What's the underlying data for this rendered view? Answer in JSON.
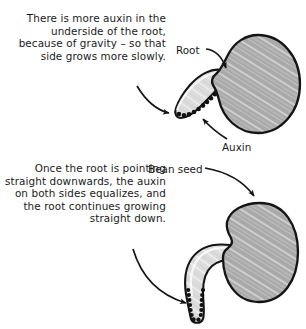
{
  "canvas": {
    "width": 306,
    "height": 329,
    "background_color": "#ffffff",
    "ink_color": "#1a1a1a"
  },
  "palette": {
    "seed_fill": "#a9a9a9",
    "seed_hatch_light": "#e8e8e8",
    "root_fill": "#dcdcdc",
    "root_shade": "#bdbdbd",
    "auxin_dot": "#111111",
    "outline": "#141414"
  },
  "captions": {
    "top": "There is more auxin in the underside of the root, because of gravity – so that side grows more slowly.",
    "bottom": "Once the root is pointing straight downwards, the auxin on both sides equalizes, and the root continues growing straight down."
  },
  "labels": {
    "root": "Root",
    "auxin": "Auxin",
    "bean_seed": "Bean seed"
  },
  "panels": [
    {
      "id": "top-panel",
      "name": "root-growing-sideways",
      "seed": {
        "cx": 257,
        "cy": 84,
        "rx": 43,
        "ry": 49,
        "orientation": "horizontal-kidney"
      },
      "root": {
        "direction": "down-left",
        "tip_x": 176,
        "tip_y": 114
      },
      "auxin_distribution": "underside-only",
      "callouts": [
        "root",
        "auxin"
      ]
    },
    {
      "id": "bottom-panel",
      "name": "root-growing-straight-down",
      "seed": {
        "cx": 260,
        "cy": 252,
        "rx": 38,
        "ry": 50,
        "orientation": "vertical-kidney"
      },
      "root": {
        "direction": "curves-left-then-down",
        "tip_x": 199,
        "tip_y": 318
      },
      "auxin_distribution": "both-sides-equal",
      "callouts": [
        "bean_seed"
      ]
    }
  ],
  "arrows": [
    {
      "name": "caption-top-to-root-tip",
      "from": [
        137,
        88
      ],
      "to": [
        172,
        114
      ]
    },
    {
      "name": "root-label-to-seed",
      "from": [
        206,
        50
      ],
      "to": [
        228,
        71
      ]
    },
    {
      "name": "auxin-label-to-root",
      "from": [
        224,
        138
      ],
      "to": [
        203,
        116
      ]
    },
    {
      "name": "bean-seed-label-to-seed",
      "from": [
        205,
        169
      ],
      "to": [
        253,
        199
      ]
    },
    {
      "name": "caption-bottom-to-root-tip",
      "from": [
        133,
        252
      ],
      "to": [
        192,
        302
      ]
    }
  ]
}
